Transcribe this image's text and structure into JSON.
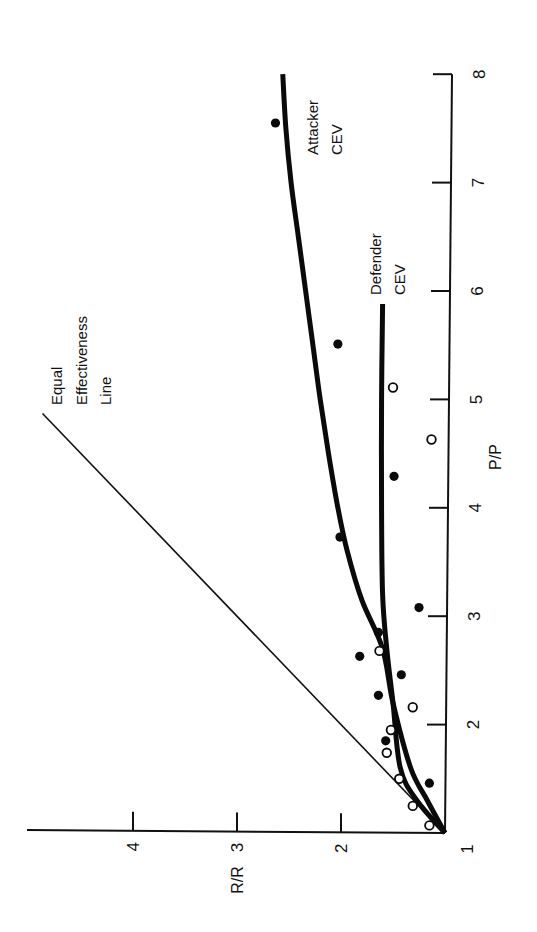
{
  "chart_data": {
    "type": "scatter",
    "orientation_note": "figure rotated 90 degrees counter-clockwise",
    "title": "",
    "xlabel": "P/P",
    "ylabel": "R/R",
    "xlim": [
      1,
      8
    ],
    "ylim": [
      1,
      5
    ],
    "x_ticks": [
      1,
      2,
      3,
      4,
      5,
      6,
      7,
      8
    ],
    "y_ticks": [
      1,
      2,
      3,
      4
    ],
    "grid": false,
    "legend": null,
    "annotations": [
      {
        "id": "equal",
        "lines": [
          "Equal",
          "Effectiveness",
          "Line"
        ]
      },
      {
        "id": "attacker",
        "lines": [
          "Attacker",
          "CEV"
        ]
      },
      {
        "id": "defender",
        "lines": [
          "Defender",
          "CEV"
        ]
      }
    ],
    "lines": [
      {
        "name": "Equal Effectiveness Line",
        "style": "thin",
        "x": [
          1,
          4.87
        ],
        "y": [
          1,
          4.87
        ]
      },
      {
        "name": "Attacker CEV",
        "style": "thick",
        "x": [
          1.0,
          1.3,
          1.6,
          2.2,
          2.7,
          3.15,
          3.6,
          4.0,
          4.5,
          5.0,
          5.5,
          6.0,
          6.5,
          7.0,
          7.5,
          8.0
        ],
        "y": [
          1.0,
          1.17,
          1.33,
          1.5,
          1.6,
          1.8,
          1.94,
          2.03,
          2.12,
          2.2,
          2.27,
          2.34,
          2.41,
          2.48,
          2.53,
          2.56
        ]
      },
      {
        "name": "Defender CEV",
        "style": "thick",
        "x": [
          1.0,
          1.3,
          1.6,
          2.2,
          2.7,
          3.2,
          4.0,
          5.0,
          5.88
        ],
        "y": [
          1.0,
          1.27,
          1.43,
          1.5,
          1.56,
          1.6,
          1.61,
          1.61,
          1.6
        ]
      }
    ],
    "series": [
      {
        "name": "Attacker (filled)",
        "marker": "filled-circle",
        "points": [
          {
            "x": 7.55,
            "y": 2.63
          },
          {
            "x": 5.51,
            "y": 2.03
          },
          {
            "x": 3.73,
            "y": 2.01
          },
          {
            "x": 4.29,
            "y": 1.49
          },
          {
            "x": 3.08,
            "y": 1.25
          },
          {
            "x": 2.85,
            "y": 1.64
          },
          {
            "x": 2.63,
            "y": 1.82
          },
          {
            "x": 2.46,
            "y": 1.42
          },
          {
            "x": 2.27,
            "y": 1.64
          },
          {
            "x": 1.85,
            "y": 1.57
          },
          {
            "x": 1.46,
            "y": 1.15
          }
        ]
      },
      {
        "name": "Defender (open)",
        "marker": "open-circle",
        "points": [
          {
            "x": 5.11,
            "y": 1.5
          },
          {
            "x": 4.63,
            "y": 1.13
          },
          {
            "x": 2.68,
            "y": 1.63
          },
          {
            "x": 2.16,
            "y": 1.31
          },
          {
            "x": 1.95,
            "y": 1.52
          },
          {
            "x": 1.74,
            "y": 1.56
          },
          {
            "x": 1.5,
            "y": 1.44
          },
          {
            "x": 1.25,
            "y": 1.31
          },
          {
            "x": 1.07,
            "y": 1.15
          }
        ]
      }
    ]
  },
  "labels": {
    "x_axis_title": "P/P",
    "y_axis_title": "R/R",
    "origin_label": "1",
    "x_tick_labels": [
      "2",
      "3",
      "4",
      "5",
      "6",
      "7",
      "8"
    ],
    "y_tick_labels": [
      "2",
      "3",
      "4"
    ],
    "equal_line": [
      "Equal",
      "Effectiveness",
      "Line"
    ],
    "attacker": [
      "Attacker",
      "CEV"
    ],
    "defender": [
      "Defender",
      "CEV"
    ]
  },
  "colors": {
    "ink": "#0a0a0a",
    "background": "#ffffff"
  }
}
